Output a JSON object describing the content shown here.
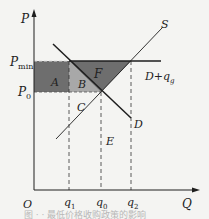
{
  "figure": {
    "axes": {
      "y_label": "P",
      "x_label": "Q",
      "origin_label": "O"
    },
    "price_levels": [
      {
        "id": "pmin",
        "label": "P",
        "sub": "min"
      },
      {
        "id": "p0",
        "label": "P",
        "sub": "0"
      }
    ],
    "quantity_levels": [
      {
        "id": "q1",
        "label": "q",
        "sub": "1"
      },
      {
        "id": "q0",
        "label": "q",
        "sub": "0"
      },
      {
        "id": "q2",
        "label": "q",
        "sub": "2"
      }
    ],
    "curves": {
      "supply": "S",
      "demand": "D",
      "demand_plus": "D+q",
      "demand_plus_sub": "g"
    },
    "regions": {
      "A": "A",
      "B": "B",
      "C": "C",
      "E": "E",
      "F": "F"
    },
    "colors": {
      "dark_fill": "#6e6e6e",
      "light_fill": "#a8a8a8",
      "line": "#1e1e1e",
      "background": "#f4f4f2"
    },
    "caption": "图 ·  ·   最低价格收购政策的影响"
  }
}
